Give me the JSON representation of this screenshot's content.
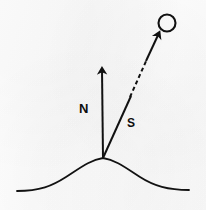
{
  "figure": {
    "background_color": "#fdfdfd",
    "ink_color": "#111111",
    "width": 206,
    "height": 210
  },
  "labels": {
    "normal_vector": "N",
    "source_vector": "S"
  },
  "elements": {
    "light_source": {
      "name": "light-source-circle",
      "center_x": 167,
      "center_y": 23,
      "radius": 8.5,
      "stroke_width": 2.1,
      "fill": "none"
    },
    "normal_arrow": {
      "name": "normal-vector-arrow",
      "from_x": 103,
      "from_y": 158,
      "to_x": 102,
      "to_y": 67,
      "stroke_width": 2.0,
      "arrowhead": "solid-triangle"
    },
    "source_arrow": {
      "name": "source-vector-arrow",
      "from_x": 103,
      "from_y": 158,
      "to_x": 160,
      "to_y": 31,
      "stroke_width": 2.0,
      "arrowhead": "solid-triangle",
      "dashed_segment": {
        "start_x": 130,
        "start_y": 96,
        "end_x": 146,
        "end_y": 60,
        "dash_pattern": "4 3"
      }
    },
    "surface_curve": {
      "name": "surface-profile-curve",
      "stroke_width": 1.8,
      "apex_x": 103,
      "apex_y": 158,
      "left_end_x": 17,
      "left_end_y": 191,
      "right_end_x": 189,
      "right_end_y": 190
    }
  }
}
